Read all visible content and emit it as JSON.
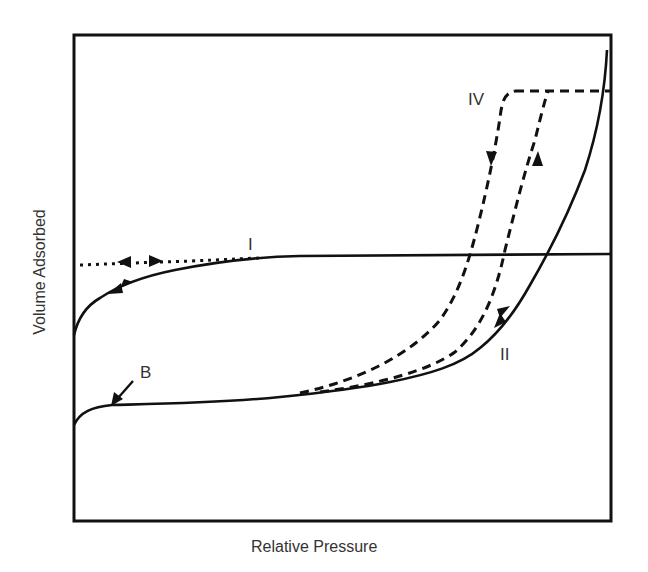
{
  "figure": {
    "type": "adsorption-isotherm-diagram",
    "xlabel": "Relative Pressure",
    "ylabel": "Volume Adsorbed",
    "curve_labels": {
      "type_I": "I",
      "type_II": "II",
      "type_IV": "IV",
      "point_B": "B"
    },
    "colors": {
      "line": "#111111",
      "text": "#333333",
      "background": "#ffffff"
    },
    "curves": [
      {
        "name": "I",
        "style": "solid",
        "description": "Type I isotherm: steep rise then plateau, with dotted desorption branch and bidirectional arrows"
      },
      {
        "name": "II",
        "style": "solid",
        "description": "Type II isotherm with knee at point B, rising steeply near saturation"
      },
      {
        "name": "IV",
        "style": "dashed",
        "description": "Type IV isotherm with hysteresis loop and plateau at high pressure"
      }
    ]
  }
}
